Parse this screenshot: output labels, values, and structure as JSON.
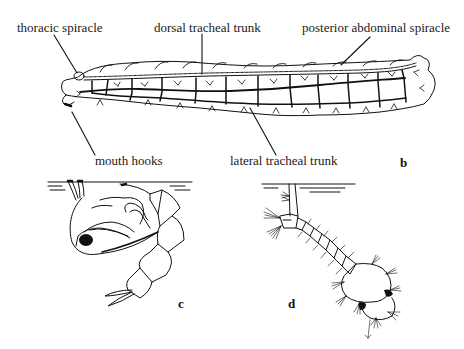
{
  "figure": {
    "panels": [
      {
        "id": "b",
        "letter": "b",
        "subject": "larva with tracheal system",
        "labels": {
          "thoracic_spiracle": "thoracic spiracle",
          "dorsal_tracheal_trunk": "dorsal tracheal trunk",
          "posterior_abdominal_spiracle": "posterior abdominal spiracle",
          "mouth_hooks": "mouth hooks",
          "lateral_tracheal_trunk": "lateral tracheal trunk"
        }
      },
      {
        "id": "c",
        "letter": "c",
        "subject": "pupa at water surface"
      },
      {
        "id": "d",
        "letter": "d",
        "subject": "larva hanging from water surface"
      }
    ],
    "colors": {
      "ink": "#111111",
      "background": "#ffffff"
    }
  }
}
